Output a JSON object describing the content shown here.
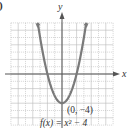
{
  "figure": {
    "corner_label": ")",
    "x_axis_label": "x",
    "y_axis_label": "y",
    "vertex_label": "(0, −4)",
    "function_label": "f(x) = x² − 4",
    "colors": {
      "curve": "#7a7a7a",
      "axis": "#555555",
      "grid": "#b8b8b8",
      "text": "#333333"
    }
  },
  "chart_data": {
    "type": "line",
    "title": "",
    "function": "f(x) = x^2 - 4",
    "xlabel": "x",
    "ylabel": "y",
    "xlim": [
      -7,
      7
    ],
    "ylim": [
      -7,
      7
    ],
    "grid": true,
    "legend": null,
    "annotations": [
      {
        "text": "(0, -4)",
        "x": 0,
        "y": -4,
        "role": "vertex"
      },
      {
        "text": "f(x) = x^2 - 4",
        "role": "function label"
      }
    ],
    "series": [
      {
        "name": "f(x) = x^2 - 4",
        "x": [
          -3.3,
          -3,
          -2.5,
          -2,
          -1.5,
          -1,
          -0.5,
          0,
          0.5,
          1,
          1.5,
          2,
          2.5,
          3,
          3.3
        ],
        "y": [
          6.89,
          5,
          2.25,
          0,
          -1.75,
          -3,
          -3.75,
          -4,
          -3.75,
          -3,
          -1.75,
          0,
          2.25,
          5,
          6.89
        ]
      }
    ]
  }
}
